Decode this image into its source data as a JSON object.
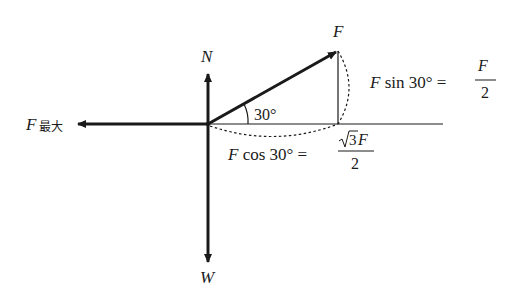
{
  "diagram": {
    "type": "force-diagram",
    "forces": {
      "N": {
        "label": "N",
        "direction": "up"
      },
      "W": {
        "label": "W",
        "direction": "down"
      },
      "F": {
        "label": "F",
        "direction": "30° above horizontal, right"
      },
      "Fmax": {
        "label": "F",
        "subscript": "最大",
        "direction": "left"
      }
    },
    "angle_label": "30°",
    "components": {
      "vertical": {
        "lhs": "F sin 30° =",
        "lhs_F": "F",
        "lhs_rest": " sin 30° =",
        "numerator": "F",
        "denominator": "2"
      },
      "horizontal": {
        "lhs_F": "F",
        "lhs_rest": " cos 30° =",
        "numerator_root": "3",
        "numerator_F": "F",
        "denominator": "2"
      }
    },
    "colors": {
      "ink": "#1a1a1a",
      "background": "#ffffff"
    }
  }
}
